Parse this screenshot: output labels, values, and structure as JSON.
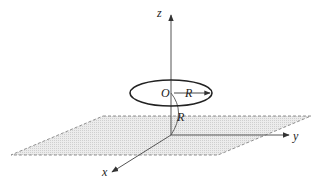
{
  "diagram": {
    "axes": {
      "x_label": "x",
      "y_label": "y",
      "z_label": "z"
    },
    "ring": {
      "center_label": "O",
      "radius_label": "R"
    },
    "height_label": "R",
    "colors": {
      "line": "#333333",
      "plane_fill": "#e6e6e6",
      "plane_edge": "#777777"
    }
  }
}
